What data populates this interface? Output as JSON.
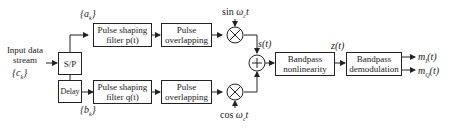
{
  "diagram": {
    "input": {
      "line1": "Input data",
      "line2": "stream",
      "symbol": "{c_k}"
    },
    "blocks": {
      "sp": "S/P",
      "delay": "Delay",
      "pulse_shaping_p_line1": "Pulse shaping",
      "pulse_shaping_p_line2": "filter p(t)",
      "pulse_shaping_q_line1": "Pulse shaping",
      "pulse_shaping_q_line2": "filter q(t)",
      "overlap_top_line1": "Pulse",
      "overlap_top_line2": "overlapping",
      "overlap_bottom_line1": "Pulse",
      "overlap_bottom_line2": "overlapping",
      "nonlinearity_line1": "Bandpass",
      "nonlinearity_line2": "nonlinearity",
      "demod_line1": "Bandpass",
      "demod_line2": "demodulation"
    },
    "labels": {
      "a_k": "{a_k}",
      "b_k": "{b_k}",
      "sin_carrier": "sin ω_c t",
      "cos_carrier": "cos ω_c t",
      "s_t": "s(t)",
      "z_t": "z(t)",
      "m_i": "m_I(t)",
      "m_q": "m_Q(t)"
    }
  }
}
